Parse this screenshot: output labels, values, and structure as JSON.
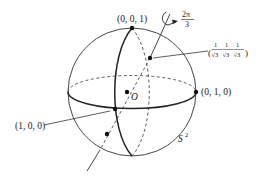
{
  "figure": {
    "type": "unit-sphere-rotation-diagram",
    "sphere_label": "S",
    "sphere_label_sup": "2",
    "origin_label": "O",
    "rotation_angle": {
      "numerator": "2π",
      "denominator": "3"
    },
    "points": {
      "north": "(0, 0, 1)",
      "x_axis": "(1, 0, 0)",
      "y_axis": "(0, 1, 0)",
      "diagonal": {
        "open": "(",
        "frac_num": "1",
        "frac_den": "√3",
        "close": ")"
      }
    },
    "colors": {
      "ink": "#222222",
      "background": "#ffffff"
    }
  }
}
